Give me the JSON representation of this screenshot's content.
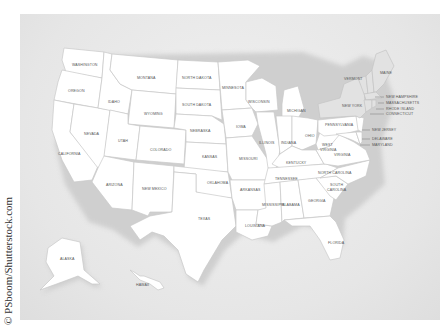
{
  "map": {
    "title": "United States map with state names",
    "background_color": "#e6e6e6",
    "state_fill": "#ffffff",
    "state_border": "#c8c8c8",
    "northeast_fill": "#e2e2e2",
    "states": {
      "washington": "WASHINGTON",
      "oregon": "OREGON",
      "california": "CALIFORNIA",
      "nevada": "NEVADA",
      "idaho": "IDAHO",
      "montana": "MONTANA",
      "wyoming": "WYOMING",
      "utah": "UTAH",
      "arizona": "ARIZONA",
      "colorado": "COLORADO",
      "new_mexico": "NEW MEXICO",
      "north_dakota": "NORTH DAKOTA",
      "south_dakota": "SOUTH DAKOTA",
      "nebraska": "NEBRASKA",
      "kansas": "KANSAS",
      "oklahoma": "OKLAHOMA",
      "texas": "TEXAS",
      "minnesota": "MINNESOTA",
      "iowa": "IOWA",
      "missouri": "MISSOURI",
      "arkansas": "ARKANSAS",
      "louisiana": "LOUISIANA",
      "wisconsin": "WISCONSIN",
      "illinois": "ILLINOIS",
      "michigan": "MICHIGAN",
      "indiana": "INDIANA",
      "ohio": "OHIO",
      "kentucky": "KENTUCKY",
      "tennessee": "TENNESSEE",
      "mississippi": "MISSISSIPPI",
      "alabama": "ALABAMA",
      "georgia": "GEORGIA",
      "florida": "FLORIDA",
      "south_carolina_1": "SOUTH",
      "south_carolina_2": "CAROLINA",
      "north_carolina": "NORTH CAROLINA",
      "virginia": "VIRGINIA",
      "west_virginia_1": "WEST",
      "west_virginia_2": "VIRGINIA",
      "pennsylvania": "PENNSYLVANIA",
      "new_york": "NEW YORK",
      "vermont": "VERMONT",
      "maine": "MAINE",
      "new_hampshire": "NEW HAMPSHIRE",
      "massachusetts": "MASSACHUSETTS",
      "rhode_island": "RHODE ISLAND",
      "connecticut": "CONNECTICUT",
      "new_jersey": "NEW JERSEY",
      "delaware": "DELAWARE",
      "maryland": "MARYLAND",
      "alaska": "ALASKA",
      "hawaii": "HAWAII"
    }
  },
  "credit": "© PSboom/Shutterstock.com"
}
